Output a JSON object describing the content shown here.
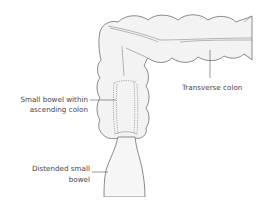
{
  "diagram": {
    "type": "anatomical illustration",
    "labels": {
      "transverse_colon": "Transverse colon",
      "small_bowel_line1": "Small bowel within",
      "small_bowel_line2": "ascending colon",
      "distended_line1": "Distended small",
      "distended_line2": "bowel"
    },
    "colors": {
      "background": "#ffffff",
      "outline": "#6e6e6e",
      "fill": "#f3f3f3",
      "text": "#444444"
    }
  }
}
